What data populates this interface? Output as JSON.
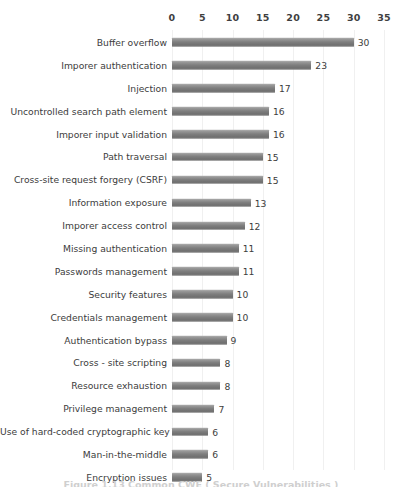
{
  "chart_data": {
    "type": "bar",
    "orientation": "horizontal",
    "title": "",
    "xlabel": "",
    "ylabel": "",
    "xlim": [
      0,
      35
    ],
    "xticks": [
      0,
      5,
      10,
      15,
      20,
      25,
      30,
      35
    ],
    "grid": true,
    "legend": null,
    "bar_color": "#7e7e7e",
    "categories": [
      "Buffer overflow",
      "Imporer authentication",
      "Injection",
      "Uncontrolled search path element",
      "Imporer input validation",
      "Path traversal",
      "Cross-site request forgery (CSRF)",
      "Information exposure",
      "Imporer access control",
      "Missing authentication",
      "Passwords management",
      "Security features",
      "Credentials management",
      "Authentication bypass",
      "Cross - site scripting",
      "Resource exhaustion",
      "Privilege management",
      "Use of hard-coded cryptographic key",
      "Man-in-the-middle",
      "Encryption issues"
    ],
    "values": [
      30,
      23,
      17,
      16,
      16,
      15,
      15,
      13,
      12,
      11,
      11,
      10,
      10,
      9,
      8,
      8,
      7,
      6,
      6,
      5
    ]
  },
  "caption": {
    "text": "Figure 1.13   Common CWE ( Secure Vulnerabilities )"
  }
}
